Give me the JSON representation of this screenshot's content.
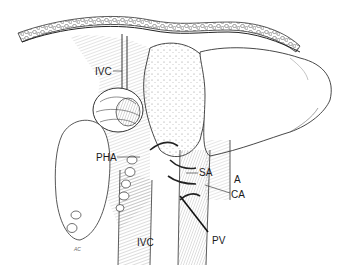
{
  "figure": {
    "type": "anatomical-illustration",
    "colors": {
      "ink": "#1a1a1a",
      "shade": "#555555",
      "paper": "#ffffff"
    }
  },
  "labels": [
    {
      "id": "ivc_top",
      "text": "IVC",
      "x": 95,
      "y": 67
    },
    {
      "id": "pha",
      "text": "PHA",
      "x": 96,
      "y": 153
    },
    {
      "id": "sa",
      "text": "SA",
      "x": 199,
      "y": 170
    },
    {
      "id": "a",
      "text": "A",
      "x": 234,
      "y": 175
    },
    {
      "id": "ca",
      "text": "CA",
      "x": 231,
      "y": 190
    },
    {
      "id": "ivc_bottom",
      "text": "IVC",
      "x": 137,
      "y": 238
    },
    {
      "id": "pv",
      "text": "PV",
      "x": 212,
      "y": 236
    }
  ],
  "signature": "AC"
}
